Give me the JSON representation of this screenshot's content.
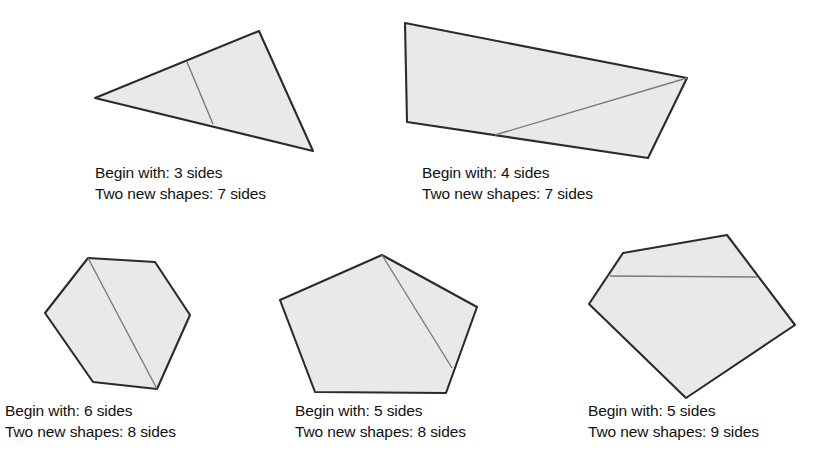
{
  "figure": {
    "style": {
      "shape_fill": "#e9e9e9",
      "shape_outline": "#2b2b2b",
      "cut_line_color": "#7a7a7a",
      "text_color": "#111111",
      "background": "#ffffff"
    },
    "labels": {
      "begin_prefix": "Begin with:",
      "result_prefix": "Two new shapes:",
      "unit": "sides"
    },
    "examples": [
      {
        "id": "triangle",
        "shape_name": "triangle",
        "begin_sides": 3,
        "result_sides": 7,
        "caption_line1": "Begin with: 3 sides",
        "caption_line2": "Two new shapes: 7 sides",
        "polygon_points": "95,98 259,31 313,151",
        "cut_line": {
          "x1": 187,
          "y1": 62,
          "x2": 213,
          "y2": 124
        }
      },
      {
        "id": "quadrilateral",
        "shape_name": "quadrilateral",
        "begin_sides": 4,
        "result_sides": 7,
        "caption_line1": "Begin with: 4 sides",
        "caption_line2": "Two new shapes: 7 sides",
        "polygon_points": "405,23 687,78 648,158 407,122",
        "cut_line": {
          "x1": 495,
          "y1": 135,
          "x2": 687,
          "y2": 78
        }
      },
      {
        "id": "hexagon",
        "shape_name": "hexagon",
        "begin_sides": 6,
        "result_sides": 8,
        "caption_line1": "Begin with: 6 sides",
        "caption_line2": "Two new shapes: 8 sides",
        "polygon_points": "88,258 155,262 190,315 157,389 93,382 45,313",
        "cut_line": {
          "x1": 88,
          "y1": 258,
          "x2": 157,
          "y2": 389
        }
      },
      {
        "id": "pentagon-apex-cut",
        "shape_name": "pentagon",
        "begin_sides": 5,
        "result_sides": 8,
        "caption_line1": "Begin with: 5 sides",
        "caption_line2": "Two new shapes: 8 sides",
        "polygon_points": "382,255 477,307 446,393 315,392 280,300",
        "cut_line": {
          "x1": 382,
          "y1": 255,
          "x2": 452,
          "y2": 368
        }
      },
      {
        "id": "pentagon-cross-cut",
        "shape_name": "pentagon",
        "begin_sides": 5,
        "result_sides": 9,
        "caption_line1": "Begin with: 5 sides",
        "caption_line2": "Two new shapes: 9 sides",
        "polygon_points": "623,253 727,235 795,325 686,398 589,304",
        "cut_line": {
          "x1": 610,
          "y1": 276,
          "x2": 757,
          "y2": 277
        }
      }
    ]
  }
}
